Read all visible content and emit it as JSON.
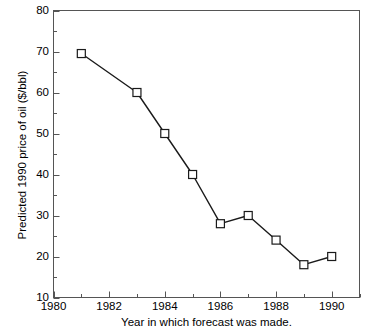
{
  "chart_data": {
    "type": "line",
    "title": "",
    "xlabel": "Year in which forecast was made.",
    "ylabel": "Predicted 1990 price of oil ($/bbl)",
    "xlim": [
      1980,
      1991
    ],
    "ylim": [
      10,
      80
    ],
    "xticks": [
      1980,
      1982,
      1984,
      1986,
      1988,
      1990
    ],
    "xtick_labels": [
      "1980",
      "1982",
      "1984",
      "1986",
      "1988",
      "1990"
    ],
    "xminor_ticks": [
      1981,
      1983,
      1985,
      1987,
      1989,
      1991
    ],
    "yticks": [
      10,
      20,
      30,
      40,
      50,
      60,
      70,
      80
    ],
    "ytick_labels": [
      "10",
      "20",
      "30",
      "40",
      "50",
      "60",
      "70",
      "80"
    ],
    "yminor_ticks": [
      15,
      25,
      35,
      45,
      55,
      65,
      75
    ],
    "grid": false,
    "legend": null,
    "marker": "open-square",
    "line_color": "#1a1a1a",
    "marker_face_color": "#ffffff",
    "marker_edge_color": "#1a1a1a",
    "x": [
      1981,
      1983,
      1984,
      1985,
      1986,
      1987,
      1988,
      1989,
      1990
    ],
    "values": [
      69.5,
      60,
      50,
      40,
      28,
      30,
      24,
      18,
      20
    ],
    "series": [
      {
        "name": "Predicted 1990 price of oil",
        "points": [
          {
            "x": 1981,
            "y": 69.5
          },
          {
            "x": 1983,
            "y": 60
          },
          {
            "x": 1984,
            "y": 50
          },
          {
            "x": 1985,
            "y": 40
          },
          {
            "x": 1986,
            "y": 28
          },
          {
            "x": 1987,
            "y": 30
          },
          {
            "x": 1988,
            "y": 24
          },
          {
            "x": 1989,
            "y": 18
          },
          {
            "x": 1990,
            "y": 20
          }
        ]
      }
    ]
  }
}
